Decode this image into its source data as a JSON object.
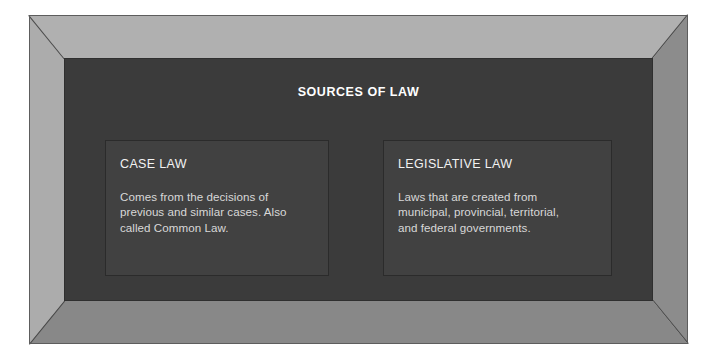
{
  "frame": {
    "label": "picture-frame",
    "colors": {
      "bevel_top": "#b0b0b0",
      "bevel_left": "#acacac",
      "bevel_right": "#8c8c8c",
      "bevel_bottom": "#888888",
      "outline": "#5d5d5d",
      "miter_seam": "#4a4a4a"
    }
  },
  "panel": {
    "title": "SOURCES OF LAW",
    "background": "#3b3b3b",
    "title_color": "#ffffff"
  },
  "cards": [
    {
      "id": "case-law",
      "heading": "CASE LAW",
      "body": "Comes from the decisions of\nprevious and similar cases. Also\ncalled Common Law.",
      "background": "#414141",
      "border": "#2b2b2b"
    },
    {
      "id": "legislative-law",
      "heading": "LEGISLATIVE LAW",
      "body": "Laws that are created from\nmunicipal, provincial, territorial,\nand federal governments.",
      "background": "#414141",
      "border": "#2b2b2b"
    }
  ]
}
